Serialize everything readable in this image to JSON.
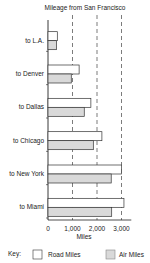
{
  "chart_data": {
    "type": "bar",
    "orientation": "horizontal",
    "title": "Mileage from San Francisco",
    "xlabel": "Miles",
    "ylabel": "",
    "categories": [
      "to L.A.",
      "to Denver",
      "to Dallas",
      "to Chicago",
      "to New York",
      "to Miami"
    ],
    "series": [
      {
        "name": "Road Miles",
        "color": "#ffffff",
        "values": [
          380,
          1270,
          1750,
          2200,
          3000,
          3100
        ]
      },
      {
        "name": "Air Miles",
        "color": "#d9d9d9",
        "values": [
          350,
          950,
          1480,
          1850,
          2580,
          2600
        ]
      }
    ],
    "xlim": [
      0,
      3400
    ],
    "xticks": [
      0,
      1000,
      2000,
      3000
    ],
    "xtick_labels": [
      "0",
      "1,000",
      "2,000",
      "3,000"
    ],
    "grid": "vertical dashed",
    "legend": {
      "title": "Key:",
      "position": "bottom"
    }
  }
}
